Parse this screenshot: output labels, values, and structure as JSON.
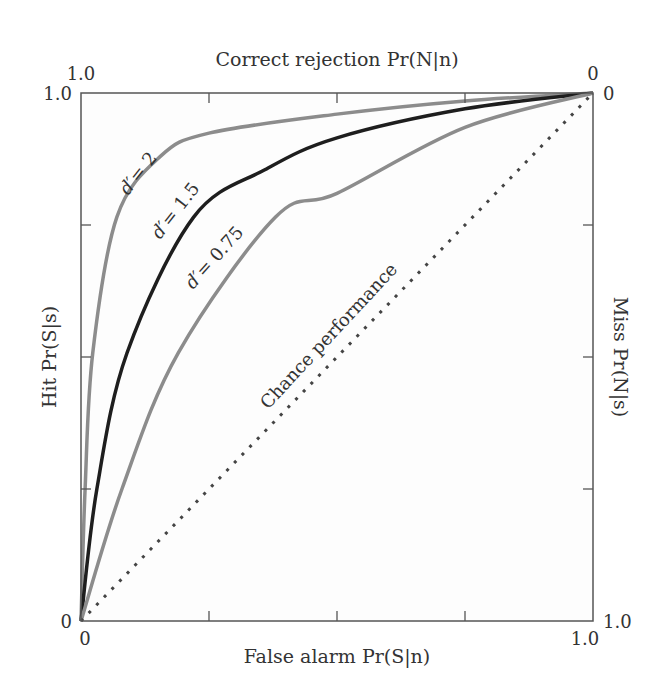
{
  "chart_data": {
    "type": "line",
    "title": "",
    "xlabel": "False alarm Pr(S|n)",
    "ylabel": "Hit Pr(S|s)",
    "top_xlabel": "Correct rejection Pr(N|n)",
    "right_ylabel": "Miss Pr(N|s)",
    "xlim": [
      0,
      1
    ],
    "ylim": [
      0,
      1
    ],
    "grid": false,
    "legend": "inline labels on curves",
    "axis_tick_labels": {
      "bottom": {
        "left": "0",
        "right": "1.0"
      },
      "left": {
        "bottom": "0",
        "top": "1.0"
      },
      "top": {
        "left": "1.0",
        "right": "0"
      },
      "right": {
        "top": "0",
        "bottom": "1.0"
      }
    },
    "ticks": [
      0.25,
      0.5,
      0.75
    ],
    "series": [
      {
        "name": "d' = 2",
        "label_prefix": "d′",
        "label_value": "= 2",
        "color": "#8c8c8c",
        "style": "solid",
        "x": [
          0,
          0.008,
          0.023,
          0.07,
          0.155,
          0.25,
          0.5,
          0.75,
          1.0
        ],
        "y": [
          0,
          0.25,
          0.508,
          0.765,
          0.88,
          0.924,
          0.96,
          0.985,
          1.0
        ]
      },
      {
        "name": "d' = 1.5",
        "label_prefix": "d′",
        "label_value": "= 1.5",
        "color": "#1e1e1e",
        "style": "solid",
        "x": [
          0,
          0.031,
          0.09,
          0.22,
          0.36,
          0.5,
          0.75,
          1.0
        ],
        "y": [
          0,
          0.25,
          0.508,
          0.765,
          0.855,
          0.915,
          0.97,
          1.0
        ]
      },
      {
        "name": "d' = 0.75",
        "label_prefix": "d′",
        "label_value": "= 0.75",
        "color": "#8c8c8c",
        "style": "solid",
        "x": [
          0,
          0.08,
          0.19,
          0.38,
          0.5,
          0.75,
          1.0
        ],
        "y": [
          0,
          0.25,
          0.508,
          0.765,
          0.81,
          0.935,
          1.0
        ]
      },
      {
        "name": "Chance performance",
        "color": "#444444",
        "style": "dotted",
        "x": [
          0,
          1
        ],
        "y": [
          0,
          1
        ]
      }
    ],
    "annotations": [
      {
        "text": "Chance performance",
        "x": 0.38,
        "y": 0.48,
        "rotation": -46
      }
    ]
  }
}
